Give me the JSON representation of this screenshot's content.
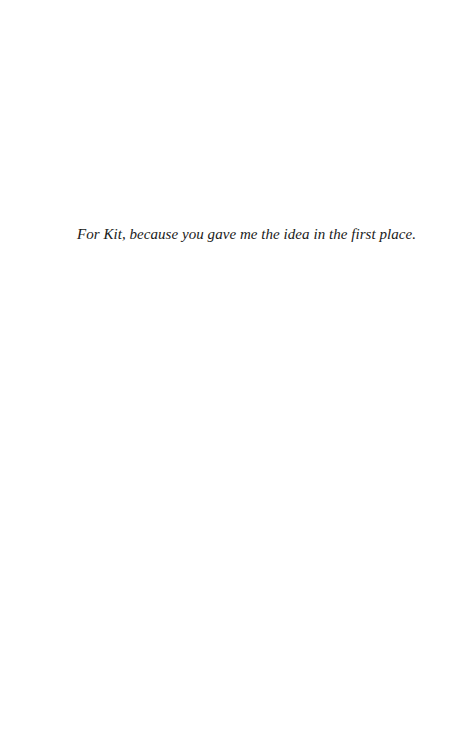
{
  "page": {
    "type": "dedication",
    "dedication_text": "For Kit, because you gave me the idea in the first place."
  }
}
